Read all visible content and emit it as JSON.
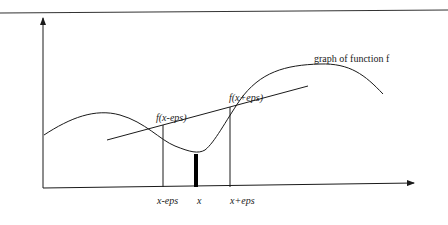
{
  "diagram": {
    "title_label": "graph of function f",
    "point_labels": {
      "left": "f(x-eps)",
      "right": "f(x+eps)"
    },
    "x_tick_labels": {
      "left": "x-eps",
      "center": "x",
      "right": "x+eps"
    },
    "colors": {
      "ink": "#1a1a1a",
      "background": "#ffffff"
    }
  }
}
